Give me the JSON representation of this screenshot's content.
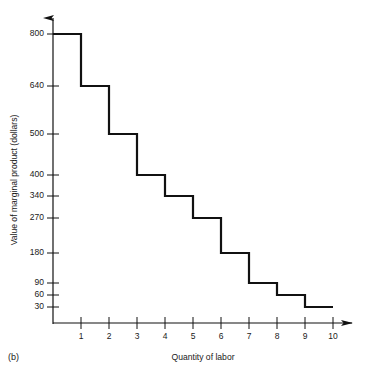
{
  "figure": {
    "caption": "(b)",
    "background": "#ffffff",
    "ink_color": "#111111"
  },
  "chart_data": {
    "type": "bar",
    "title": "",
    "subtitle": "",
    "xlabel": "Quantity of labor",
    "ylabel": "Value of marginal product (dollars)",
    "style": "step",
    "grid": false,
    "legend": false,
    "xlim": [
      0,
      10
    ],
    "ylim": [
      0,
      800
    ],
    "categories": [
      "1",
      "2",
      "3",
      "4",
      "5",
      "6",
      "7",
      "8",
      "9",
      "10"
    ],
    "values": [
      800,
      640,
      500,
      400,
      340,
      270,
      180,
      90,
      60,
      30
    ],
    "x_tick_labels": [
      "1",
      "2",
      "3",
      "4",
      "5",
      "6",
      "7",
      "8",
      "9",
      "10"
    ],
    "y_tick_labels": [
      "800",
      "640",
      "500",
      "400",
      "340",
      "270",
      "180",
      "90",
      "60",
      "30"
    ],
    "y_tick_values": [
      800,
      640,
      500,
      400,
      340,
      270,
      180,
      90,
      60,
      30
    ],
    "annotations": [
      "(b)"
    ],
    "points": [
      {
        "quantity": 1,
        "value_of_marginal_product": 800
      },
      {
        "quantity": 2,
        "value_of_marginal_product": 640
      },
      {
        "quantity": 3,
        "value_of_marginal_product": 500
      },
      {
        "quantity": 4,
        "value_of_marginal_product": 400
      },
      {
        "quantity": 5,
        "value_of_marginal_product": 340
      },
      {
        "quantity": 6,
        "value_of_marginal_product": 270
      },
      {
        "quantity": 7,
        "value_of_marginal_product": 180
      },
      {
        "quantity": 8,
        "value_of_marginal_product": 90
      },
      {
        "quantity": 9,
        "value_of_marginal_product": 60
      },
      {
        "quantity": 10,
        "value_of_marginal_product": 30
      }
    ]
  }
}
